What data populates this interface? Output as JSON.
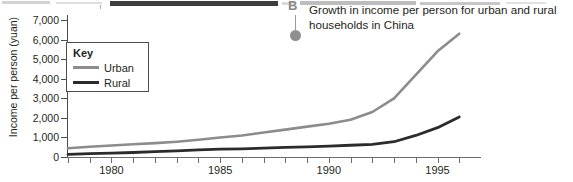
{
  "callout": {
    "letter": "B",
    "dot_color": "#8f8f8f"
  },
  "chart_title": {
    "line1": "Growth in income per person for urban and rural",
    "line2": "households in China"
  },
  "legend": {
    "title": "Key",
    "entries": [
      {
        "label": "Urban",
        "color": "#8c8c8c"
      },
      {
        "label": "Rural",
        "color": "#2b2b2b"
      }
    ]
  },
  "chart_data": {
    "type": "line",
    "title": "Growth in income per person for urban and rural households in China",
    "xlabel": "",
    "ylabel": "Income per person (yuan)",
    "xlim": [
      1978,
      1997
    ],
    "ylim": [
      0,
      7000
    ],
    "ytick_labels": [
      "7,000",
      "6,000",
      "5,000",
      "4,000",
      "3,000",
      "2,000",
      "1,000",
      "0"
    ],
    "ytick_values": [
      7000,
      6000,
      5000,
      4000,
      3000,
      2000,
      1000,
      0
    ],
    "xtick_labels": [
      "1980",
      "1985",
      "1990",
      "1995"
    ],
    "xtick_values": [
      1980,
      1985,
      1990,
      1995
    ],
    "xtick_minor_values": [
      1978,
      1979,
      1981,
      1982,
      1983,
      1984,
      1986,
      1987,
      1988,
      1989,
      1991,
      1992,
      1993,
      1994,
      1996
    ],
    "grid": false,
    "legend_position": "upper-left-inside",
    "x": [
      1978,
      1979,
      1980,
      1981,
      1982,
      1983,
      1984,
      1985,
      1986,
      1987,
      1988,
      1989,
      1990,
      1991,
      1992,
      1993,
      1994,
      1995,
      1996
    ],
    "series": [
      {
        "name": "Urban",
        "color": "#8c8c8c",
        "values": [
          450,
          520,
          590,
          650,
          710,
          780,
          880,
          1000,
          1100,
          1250,
          1400,
          1550,
          1700,
          1900,
          2300,
          3000,
          4200,
          5400,
          6300
        ]
      },
      {
        "name": "Rural",
        "color": "#2b2b2b",
        "values": [
          130,
          170,
          200,
          230,
          270,
          310,
          360,
          400,
          420,
          450,
          490,
          520,
          560,
          600,
          650,
          780,
          1100,
          1500,
          2050
        ]
      }
    ]
  }
}
